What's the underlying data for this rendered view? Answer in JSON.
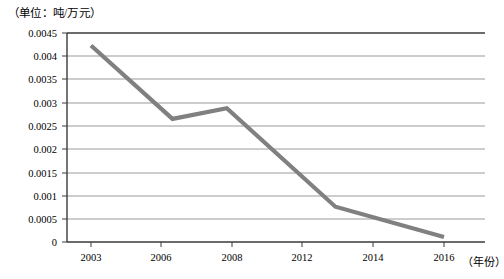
{
  "chart_data": {
    "type": "line",
    "title": "",
    "unit_caption": "（单位：吨/万元）",
    "xlabel": "（年份）",
    "ylabel": "",
    "x": [
      2003,
      2006,
      2008,
      2012,
      2016
    ],
    "categories": [
      "2003",
      "2006",
      "2008",
      "2012",
      "2016"
    ],
    "values": [
      0.00423,
      0.00265,
      0.00288,
      0.00076,
      0.00011
    ],
    "series": [
      {
        "name": "单位GDP能耗",
        "values": [
          0.00423,
          0.00265,
          0.00288,
          0.00076,
          0.00011
        ]
      }
    ],
    "xtick_labels": [
      "2003",
      "2006",
      "2008",
      "2012",
      "2014",
      "2016"
    ],
    "xtick_values": [
      2003,
      2006,
      2008,
      2012,
      2014,
      2016
    ],
    "ytick_labels": [
      "0",
      "0.0005",
      "0.001",
      "0.0015",
      "0.002",
      "0.0025",
      "0.003",
      "0.0035",
      "0.004",
      "0.0045"
    ],
    "ytick_values": [
      0,
      0.0005,
      0.001,
      0.0015,
      0.002,
      0.0025,
      0.003,
      0.0035,
      0.004,
      0.0045
    ],
    "ylim": [
      0,
      0.0045
    ],
    "xlim": [
      2001,
      2017
    ],
    "grid": "horizontal",
    "legend": "none",
    "line_color": "#808080",
    "grid_color": "#9a9a9a",
    "axis_color": "#3a3a3a",
    "background": "#ffffff"
  }
}
